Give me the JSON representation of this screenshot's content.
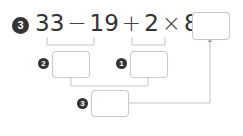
{
  "problem": {
    "number": "3",
    "expression": {
      "terms": [
        "33",
        "−",
        "19",
        "+",
        "2",
        "×",
        "8",
        "="
      ]
    },
    "answer_box": {
      "value": ""
    }
  },
  "steps": [
    {
      "order": "2",
      "label": "step-2",
      "value": "",
      "covers": "33 − 19"
    },
    {
      "order": "1",
      "label": "step-1",
      "value": "",
      "covers": "2 × 8"
    },
    {
      "order": "3",
      "label": "step-3",
      "value": "",
      "covers": "step-2 + step-1"
    }
  ],
  "colors": {
    "text": "#333333",
    "badge": "#333333",
    "line": "#bdbdbd",
    "box_border": "#c9c9c9"
  }
}
